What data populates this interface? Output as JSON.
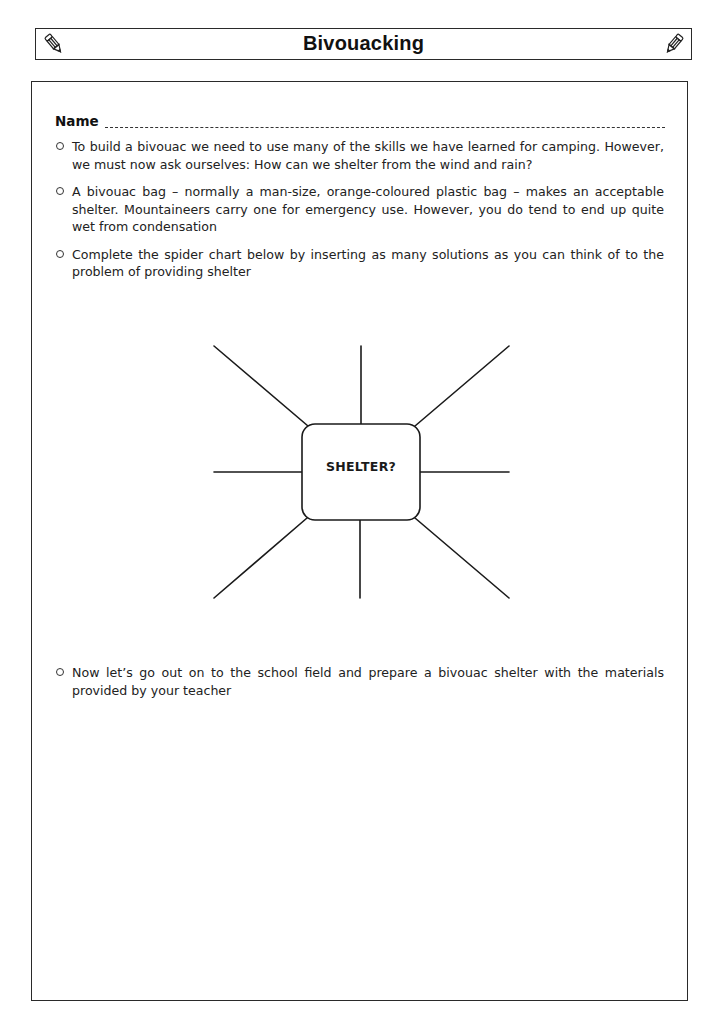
{
  "header": {
    "title": "Bivouacking",
    "left_icon": "pencil-icon",
    "right_icon": "pencil-icon"
  },
  "worksheet": {
    "name_label": "Name",
    "bullets": [
      {
        "icon": "circle-bullet",
        "text": "To build a bivouac we need to use many of the skills we have learned for camping. However, we must now ask ourselves: How can we shelter from the wind and rain?"
      },
      {
        "icon": "circle-bullet",
        "text": "A bivouac bag – normally a man-size, orange-coloured plastic bag – makes an acceptable shelter. Mountaineers carry one for emergency use. However, you do tend to end up quite wet from condensation"
      },
      {
        "icon": "circle-bullet",
        "text": "Complete the spider chart below by inserting as many solutions as you can think of to the problem of providing shelter"
      }
    ],
    "spider_chart": {
      "center_label": "SHELTER?",
      "legs": 8
    },
    "final_bullet": {
      "icon": "circle-bullet",
      "text": "Now let’s go out on to the school field and prepare a bivouac shelter with the materials provided by your teacher"
    }
  }
}
